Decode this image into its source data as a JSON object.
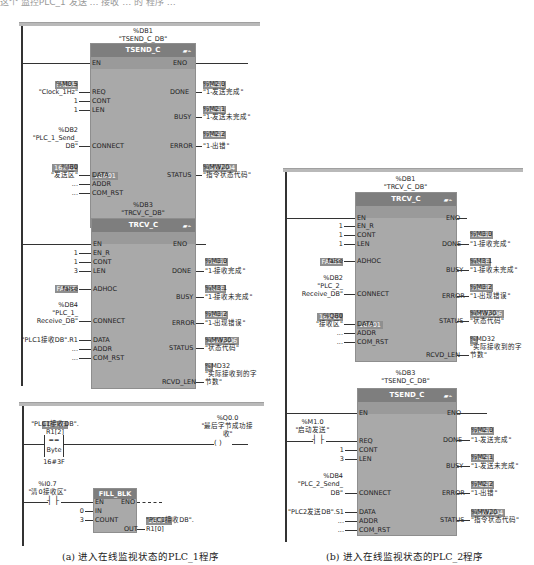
{
  "top_text": "这个 监控PLC_1 发送 … 接收 … 的 程序 …",
  "panel_a": {
    "caption": "(a) 进入在线监视状态的PLC_1程序",
    "network1": {
      "label": "程序段1",
      "tsend": {
        "db_addr": "%DB1",
        "db_name": "\"TSEND_C_DB\"",
        "title": "TSEND_C",
        "inputs": {
          "en": "EN",
          "req": {
            "pin": "REQ",
            "value": "FALSE",
            "addr": "%M0.5",
            "symbol": "\"Clock_1Hz\""
          },
          "cont": {
            "pin": "CONT",
            "arg": "1"
          },
          "len": {
            "pin": "LEN",
            "arg": "1"
          },
          "connect": {
            "pin": "CONNECT",
            "addr": "%DB2",
            "symbol1": "\"PLC_1_Send_",
            "symbol2": "DB\""
          },
          "data": {
            "pin": "DATA",
            "value": "16#01",
            "addr": "%IB0",
            "symbol": "\"发送区\"",
            "inner_value": "16#01"
          },
          "addr": {
            "pin": "ADDR",
            "arg": "..."
          },
          "com_rst": {
            "pin": "COM_RST",
            "arg": "..."
          }
        },
        "outputs": {
          "eno": "ENO",
          "done": {
            "pin": "DONE",
            "value": "FALSE",
            "addr": "%M2.0",
            "symbol": "\"1-发送完成\""
          },
          "busy": {
            "pin": "BUSY",
            "value": "FALSE",
            "addr": "%M2.1",
            "symbol": "\"1-发送未完成\""
          },
          "error": {
            "pin": "ERROR",
            "value": "FALSE",
            "addr": "%M2.2",
            "symbol": "\"1-出错\""
          },
          "status": {
            "pin": "STATUS",
            "value": "16#7004",
            "addr": "%MW20",
            "symbol": "\"指令状态代码\""
          }
        }
      },
      "trcv": {
        "db_addr": "%DB3",
        "db_name": "\"TRCV_C_DB\"",
        "title": "TRCV_C",
        "inputs": {
          "en": "EN",
          "en_r": {
            "pin": "EN_R",
            "arg": "1"
          },
          "cont": {
            "pin": "CONT",
            "arg": "1"
          },
          "len": {
            "pin": "LEN",
            "arg": "3"
          },
          "adhoc": {
            "pin": "ADHOC",
            "value": "FALSE",
            "arg": "false"
          },
          "connect": {
            "pin": "CONNECT",
            "addr": "%DB4",
            "symbol1": "\"PLC_1_",
            "symbol2": "Receive_DB\""
          },
          "data": {
            "pin": "DATA",
            "arg": "\"PLC1接收DB\".R1"
          },
          "addr": {
            "pin": "ADDR",
            "arg": "..."
          },
          "com_rst": {
            "pin": "COM_RST",
            "arg": "..."
          }
        },
        "outputs": {
          "eno": "ENO",
          "done": {
            "pin": "DONE",
            "value": "FALSE",
            "addr": "%M3.0",
            "symbol": "\"1-接收完成\""
          },
          "busy": {
            "pin": "BUSY",
            "value": "TRUE",
            "addr": "%M3.1",
            "symbol": "\"1-接收未完成\""
          },
          "error": {
            "pin": "ERROR",
            "value": "FALSE",
            "addr": "%M3.2",
            "symbol": "\"1-出现错误\""
          },
          "status": {
            "pin": "STATUS",
            "value": "16#7006",
            "addr": "%MW30",
            "symbol": "\"状态代码\""
          },
          "rcvd_len": {
            "pin": "RCVD_LEN",
            "value": "0",
            "addr": "%MD32",
            "symbol1": "\"实际接收到的字",
            "symbol2": "节数\""
          }
        }
      }
    },
    "network2": {
      "label": "程序段2",
      "compare": {
        "value": "16#3F",
        "operand1a": "\"PLC1接收DB\".",
        "operand1b": "R1[2]",
        "op": "==",
        "type": "Byte",
        "operand2": "16#3F"
      },
      "coil": {
        "addr": "%Q0.0",
        "symbol1": "\"最后字节成功接",
        "symbol2": "收\"",
        "glyph": "( )"
      },
      "contact": {
        "addr": "%I0.7",
        "symbol": "\"清0接收区\"",
        "glyph": "┤ ├"
      },
      "fill_blk": {
        "title": "FILL_BLK",
        "en": "EN",
        "eno": "ENO",
        "in": {
          "pin": "IN",
          "arg": "0"
        },
        "count": {
          "pin": "COUNT",
          "arg": "3"
        },
        "out": {
          "pin": "OUT",
          "value": "16#18",
          "symbol1": "\"PLC1接收DB\".",
          "symbol2": "R1[0]"
        }
      }
    }
  },
  "panel_b": {
    "caption": "(b) 进入在线监视状态的PLC_2程序",
    "network1": {
      "label": "程序段1",
      "trcv": {
        "db_addr": "%DB1",
        "db_name": "\"TRCV_C_DB\"",
        "title": "TRCV_C",
        "inputs": {
          "en": "EN",
          "en_r": {
            "pin": "EN_R",
            "arg": "1"
          },
          "cont": {
            "pin": "CONT",
            "arg": "1"
          },
          "len": {
            "pin": "LEN",
            "arg": "1"
          },
          "adhoc": {
            "pin": "ADHOC",
            "value": "FALSE",
            "arg": "false"
          },
          "connect": {
            "pin": "CONNECT",
            "addr": "%DB2",
            "symbol1": "\"PLC_2_",
            "symbol2": "Receive_DB\""
          },
          "data": {
            "pin": "DATA",
            "value": "16#01",
            "addr": "%QB0",
            "symbol": "\"接收区\"",
            "inner_value": "16#01"
          },
          "addr": {
            "pin": "ADDR",
            "arg": "..."
          },
          "com_rst": {
            "pin": "COM_RST",
            "arg": "..."
          }
        },
        "outputs": {
          "eno": "ENO",
          "done": {
            "pin": "DONE",
            "value": "FALSE",
            "addr": "%M3.0",
            "symbol": "\"1-接收完成\""
          },
          "busy": {
            "pin": "BUSY",
            "value": "TRUE",
            "addr": "%M3.1",
            "symbol": "\"1-接收未完成\""
          },
          "error": {
            "pin": "ERROR",
            "value": "FALSE",
            "addr": "%M3.2",
            "symbol": "\"1-出现错误\""
          },
          "status": {
            "pin": "STATUS",
            "value": "16#7006",
            "addr": "%MW30",
            "symbol": "\"状态代码\""
          },
          "rcvd_len": {
            "pin": "RCVD_LEN",
            "value": "0",
            "addr": "%MD32",
            "symbol1": "\"实际接收到的字",
            "symbol2": "节数\""
          }
        }
      },
      "tsend": {
        "db_addr": "%DB3",
        "db_name": "\"TSEND_C_DB\"",
        "title": "TSEND_C",
        "inputs": {
          "en": "EN",
          "req": {
            "pin": "REQ",
            "addr": "%M1.0",
            "symbol": "\"启动发送\"",
            "glyph": "┤ ├"
          },
          "cont": {
            "pin": "CONT",
            "arg": "1"
          },
          "len": {
            "pin": "LEN",
            "arg": "3"
          },
          "connect": {
            "pin": "CONNECT",
            "addr": "%DB4",
            "symbol1": "\"PLC_2_Send_",
            "symbol2": "DB\""
          },
          "data": {
            "pin": "DATA",
            "arg": "\"PLC2发送DB\".S1"
          },
          "addr": {
            "pin": "ADDR",
            "arg": "..."
          },
          "com_rst": {
            "pin": "COM_RST",
            "arg": "..."
          }
        },
        "outputs": {
          "eno": "ENO",
          "done": {
            "pin": "DONE",
            "value": "FALSE",
            "addr": "%M2.0",
            "symbol": "\"1-发送完成\""
          },
          "busy": {
            "pin": "BUSY",
            "value": "FALSE",
            "addr": "%M2.1",
            "symbol": "\"1-发送未完成\""
          },
          "error": {
            "pin": "ERROR",
            "value": "FALSE",
            "addr": "%M2.2",
            "symbol": "\"1-出错\""
          },
          "status": {
            "pin": "STATUS",
            "value": "16#7004",
            "addr": "%MW20",
            "symbol": "\"指令状态代码\""
          }
        }
      }
    }
  },
  "icons": {
    "block_icon": "▰⌁"
  }
}
